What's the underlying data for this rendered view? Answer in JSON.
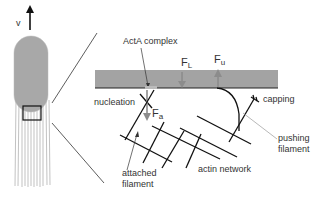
{
  "diagram": {
    "velocity_label": "v",
    "labels": {
      "actA_complex": "ActA complex",
      "nucleation": "nucleation",
      "capping": "capping",
      "pushing_filament_line1": "pushing",
      "pushing_filament_line2": "filament",
      "attached_filament_line1": "attached",
      "attached_filament_line2": "filament",
      "actin_network": "actin network"
    },
    "forces": {
      "F_L": {
        "main": "F",
        "sub": "L"
      },
      "F_u": {
        "main": "F",
        "sub": "u"
      },
      "F_a": {
        "main": "F",
        "sub": "a"
      }
    },
    "colors": {
      "bacterium_fill": "#a8a8a8",
      "membrane_bar": "#a3a3a3",
      "force_arrow": "#8c8c8c",
      "line": "#1a1a1a",
      "leader_line": "#9a9a9a"
    }
  }
}
